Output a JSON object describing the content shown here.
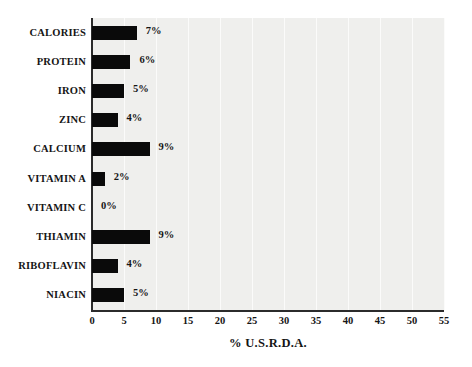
{
  "chart_data": {
    "type": "bar",
    "orientation": "horizontal",
    "title": "",
    "xlabel": "% U.S.R.D.A.",
    "ylabel": "",
    "xlim": [
      0,
      55
    ],
    "xticks": [
      0,
      5,
      10,
      15,
      20,
      25,
      30,
      35,
      40,
      45,
      50,
      55
    ],
    "xtick_labels": [
      "0",
      "5",
      "10",
      "15",
      "20",
      "25",
      "30",
      "35",
      "40",
      "45",
      "50",
      "55"
    ],
    "grid": true,
    "grid_axis": "x",
    "legend": false,
    "categories": [
      "CALORIES",
      "PROTEIN",
      "IRON",
      "ZINC",
      "CALCIUM",
      "VITAMIN A",
      "VITAMIN C",
      "THIAMIN",
      "RIBOFLAVIN",
      "NIACIN"
    ],
    "values": [
      7,
      6,
      5,
      4,
      9,
      2,
      0,
      9,
      4,
      5
    ],
    "data_labels": [
      "7%",
      "6%",
      "5%",
      "4%",
      "9%",
      "2%",
      "0%",
      "9%",
      "4%",
      "5%"
    ],
    "colors": {
      "bar": "#0a0a0a",
      "plot_background": "#efefed",
      "page_background": "#ffffff",
      "axis": "#2b2b2b",
      "gridline": "#fbfbfa",
      "text": "#151515"
    }
  }
}
